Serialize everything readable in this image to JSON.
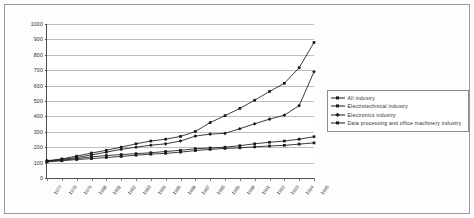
{
  "chart_data": {
    "type": "line",
    "title": "",
    "subtitle": "",
    "xlabel": "",
    "ylabel": "",
    "ylim": [
      0,
      1000
    ],
    "ytick_values": [
      0,
      100,
      200,
      300,
      400,
      500,
      600,
      700,
      800,
      900,
      1000
    ],
    "ytick_labels": [
      "0",
      "100",
      "200",
      "300",
      "400",
      "500",
      "600",
      "700",
      "800",
      "900",
      "1000"
    ],
    "grid": "horizontal",
    "legend_position": "right",
    "categories": [
      "1977",
      "1978",
      "1979",
      "1980",
      "1981",
      "1982",
      "1983",
      "1984",
      "1985",
      "1986",
      "1987",
      "1988",
      "1989",
      "1990",
      "1991",
      "1992",
      "1993",
      "1994",
      "1995"
    ],
    "series": [
      {
        "name": "All industry",
        "marker": "square",
        "color": "#1a1a1a",
        "values": [
          105,
          112,
          120,
          126,
          133,
          140,
          148,
          155,
          160,
          168,
          178,
          186,
          192,
          196,
          202,
          208,
          212,
          220,
          228
        ]
      },
      {
        "name": "Electrotechnical industry",
        "marker": "square",
        "color": "#1a1a1a",
        "values": [
          108,
          116,
          126,
          137,
          146,
          152,
          158,
          164,
          172,
          180,
          190,
          195,
          200,
          210,
          222,
          232,
          240,
          252,
          268
        ]
      },
      {
        "name": "Electronics industry",
        "marker": "diamond",
        "color": "#1a1a1a",
        "values": [
          110,
          120,
          133,
          150,
          168,
          186,
          200,
          213,
          222,
          240,
          272,
          285,
          290,
          320,
          352,
          382,
          408,
          470,
          690
        ]
      },
      {
        "name": "Data processing and office machinery industry",
        "marker": "square",
        "color": "#1a1a1a",
        "values": [
          112,
          124,
          142,
          162,
          180,
          200,
          222,
          240,
          252,
          270,
          302,
          360,
          405,
          452,
          505,
          562,
          615,
          716,
          880
        ]
      }
    ]
  },
  "legend": {
    "items": [
      {
        "label": "All industry"
      },
      {
        "label": "Electrotechnical industry"
      },
      {
        "label": "Electronics industry"
      },
      {
        "label": "Data processing and office machinery industry"
      }
    ]
  }
}
